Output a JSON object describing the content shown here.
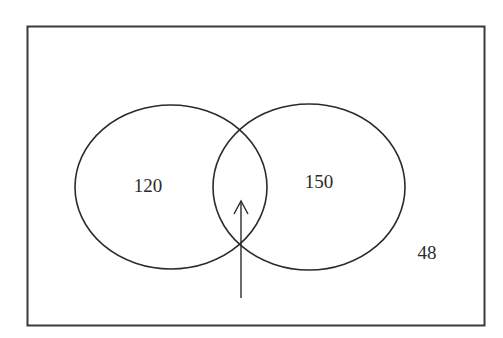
{
  "diagram": {
    "type": "venn",
    "sets": [
      {
        "id": "A",
        "only_value": "120"
      },
      {
        "id": "B",
        "only_value": "150"
      }
    ],
    "intersection_value": "",
    "outside_value": "48",
    "arrow": {
      "points_to": "intersection"
    }
  },
  "labels": {
    "set_a_only": "120",
    "set_b_only": "150",
    "outside": "48"
  },
  "colors": {
    "stroke": "#2b2b2b",
    "frame": "#3a3a3a",
    "background": "#ffffff"
  }
}
